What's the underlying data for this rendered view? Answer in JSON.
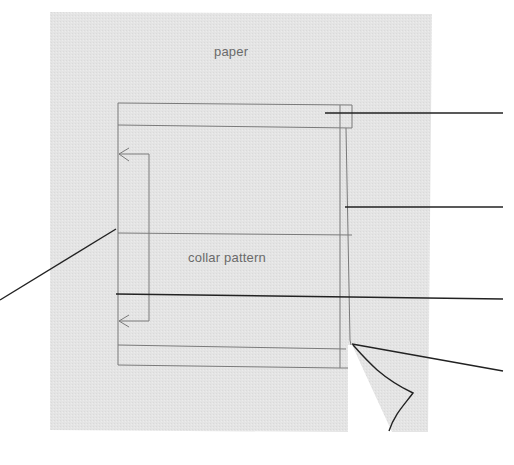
{
  "diagram": {
    "type": "sewing-pattern-illustration",
    "labels": {
      "paper": "paper",
      "collar_pattern": "collar pattern"
    },
    "colors": {
      "paper_fill": "#e3e3e3",
      "pattern_line": "#7a7a7a",
      "leader_line": "#222222",
      "background": "#ffffff",
      "text": "#6a6a6a"
    },
    "leader_lines": [
      {
        "name": "leader-top-band",
        "points": [
          [
            325,
            113
          ],
          [
            503,
            113
          ]
        ]
      },
      {
        "name": "leader-fold-line",
        "points": [
          [
            345,
            207
          ],
          [
            503,
            207
          ]
        ]
      },
      {
        "name": "leader-center-line",
        "points": [
          [
            116,
            294
          ],
          [
            503,
            299
          ]
        ]
      },
      {
        "name": "leader-paper-fold-corner",
        "points": [
          [
            352,
            344
          ],
          [
            503,
            371
          ]
        ]
      },
      {
        "name": "leader-left-edge",
        "points": [
          [
            116,
            229
          ],
          [
            0,
            300
          ]
        ]
      }
    ],
    "callout_texts": []
  }
}
